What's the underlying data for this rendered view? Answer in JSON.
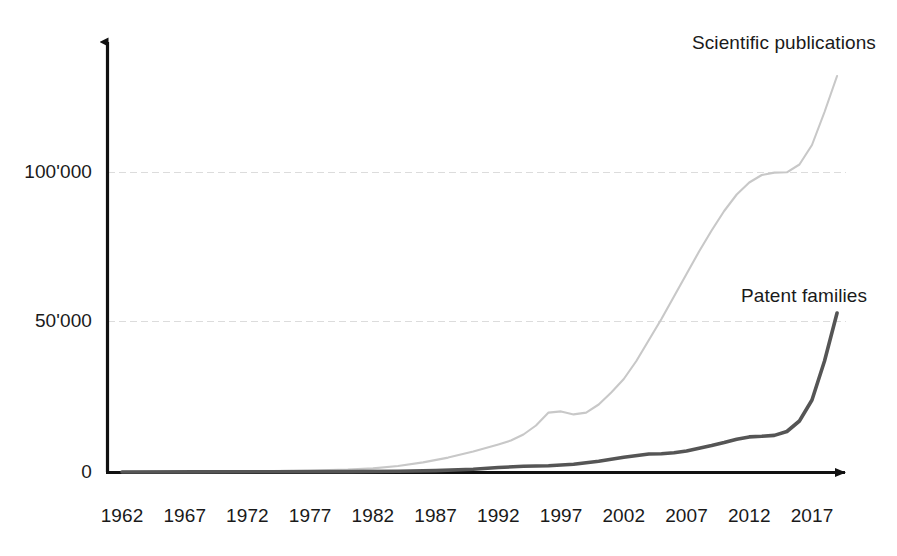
{
  "chart_data": {
    "type": "line",
    "title": "",
    "subtitle": "",
    "xlabel": "",
    "ylabel": "",
    "xlim": [
      1962,
      2019
    ],
    "ylim": [
      0,
      135000
    ],
    "grid": "horizontal-major-only",
    "legend_position": "inline-annotation",
    "x_tick_labels": [
      "1962",
      "1967",
      "1972",
      "1977",
      "1982",
      "1987",
      "1992",
      "1997",
      "2002",
      "2007",
      "2012",
      "2017"
    ],
    "x_ticks": [
      1962,
      1967,
      1972,
      1977,
      1982,
      1987,
      1992,
      1997,
      2002,
      2007,
      2012,
      2017
    ],
    "y_tick_labels": [
      "0",
      "50'000",
      "100'000"
    ],
    "y_ticks": [
      0,
      50000,
      100000
    ],
    "colors": {
      "publications": "#c8c8c8",
      "patents": "#555555",
      "axis": "#111111",
      "grid": "#dcdcdc",
      "text": "#1a1a1a",
      "background": "#ffffff"
    },
    "series": [
      {
        "name": "Scientific publications",
        "color": "#c8c8c8",
        "x": [
          1962,
          1965,
          1968,
          1971,
          1974,
          1977,
          1980,
          1982,
          1984,
          1986,
          1988,
          1990,
          1991,
          1992,
          1993,
          1994,
          1995,
          1996,
          1997,
          1998,
          1999,
          2000,
          2001,
          2002,
          2003,
          2004,
          2005,
          2006,
          2007,
          2008,
          2009,
          2010,
          2011,
          2012,
          2013,
          2014,
          2015,
          2016,
          2017,
          2018,
          2019
        ],
        "values": [
          60,
          90,
          140,
          220,
          330,
          500,
          800,
          1200,
          2000,
          3200,
          4800,
          6800,
          8000,
          9200,
          10500,
          12500,
          15500,
          19800,
          20200,
          19200,
          19800,
          22500,
          26500,
          31000,
          37000,
          44000,
          51000,
          58500,
          66000,
          73500,
          80500,
          87000,
          92500,
          96500,
          99000,
          99800,
          99900,
          102500,
          109000,
          120000,
          132000
        ]
      },
      {
        "name": "Patent families",
        "color": "#555555",
        "x": [
          1962,
          1968,
          1974,
          1980,
          1984,
          1987,
          1990,
          1992,
          1994,
          1996,
          1998,
          2000,
          2002,
          2004,
          2005,
          2006,
          2007,
          2008,
          2009,
          2010,
          2011,
          2012,
          2013,
          2014,
          2015,
          2016,
          2017,
          2018,
          2019
        ],
        "values": [
          20,
          40,
          70,
          130,
          250,
          450,
          900,
          1500,
          1900,
          2100,
          2600,
          3600,
          4900,
          6000,
          6100,
          6400,
          7000,
          7900,
          8800,
          9800,
          10900,
          11700,
          11900,
          12200,
          13500,
          17000,
          24000,
          37000,
          53000
        ]
      }
    ],
    "annotations": [
      {
        "name": "publications-label",
        "text": "Scientific publications",
        "x_px": 692,
        "y_px": 32
      },
      {
        "name": "patents-label",
        "text": "Patent families",
        "x_px": 741,
        "y_px": 285
      }
    ]
  },
  "axes": {
    "y_labels": {
      "zero": "0",
      "fifty_thousand": "50'000",
      "hundred_thousand": "100'000"
    }
  }
}
